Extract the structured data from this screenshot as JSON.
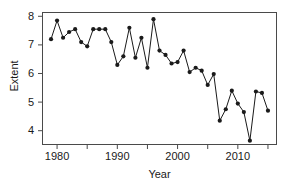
{
  "chart_data": {
    "type": "line",
    "title": "",
    "xlabel": "Year",
    "ylabel": "Extent",
    "x": [
      1979,
      1980,
      1981,
      1982,
      1983,
      1984,
      1985,
      1986,
      1987,
      1988,
      1989,
      1990,
      1991,
      1992,
      1993,
      1994,
      1995,
      1996,
      1997,
      1998,
      1999,
      2000,
      2001,
      2002,
      2003,
      2004,
      2005,
      2006,
      2007,
      2008,
      2009,
      2010,
      2011,
      2012,
      2013,
      2014,
      2015
    ],
    "values": [
      7.2,
      7.85,
      7.25,
      7.45,
      7.55,
      7.1,
      6.95,
      7.55,
      7.55,
      7.55,
      7.1,
      6.3,
      6.6,
      7.6,
      6.55,
      7.25,
      6.2,
      7.9,
      6.8,
      6.65,
      6.35,
      6.4,
      6.8,
      6.05,
      6.2,
      6.1,
      5.6,
      5.98,
      4.35,
      4.75,
      5.4,
      4.95,
      4.65,
      3.65,
      5.37,
      5.32,
      4.7
    ],
    "ylim": [
      3.5,
      8.15
    ],
    "xlim": [
      1977.5,
      2016.5
    ],
    "yticks": [
      4,
      5,
      6,
      7,
      8
    ],
    "ytick_labels": [
      "4",
      "5",
      "6",
      "7",
      "8"
    ],
    "xticks": [
      1980,
      1985,
      1990,
      1995,
      2000,
      2005,
      2010,
      2015
    ],
    "xtick_labels": [
      "1980",
      "",
      "1990",
      "",
      "2000",
      "",
      "2010",
      ""
    ],
    "grid": false,
    "legend": null,
    "marker": "filled-circle",
    "line_color": "#1a1a1a",
    "marker_color": "#1a1a1a",
    "frame_color": "#4a4a4a",
    "background": "#ffffff"
  }
}
